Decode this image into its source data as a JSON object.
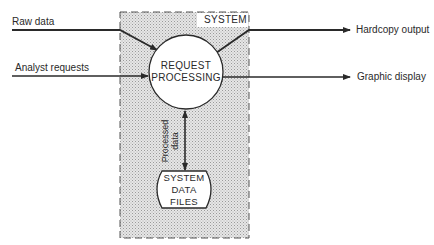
{
  "diagram": {
    "type": "data-flow",
    "system_box": {
      "label": "SYSTEM"
    },
    "process": {
      "line1": "REQUEST",
      "line2": "PROCESSING"
    },
    "data_store": {
      "line1": "SYSTEM",
      "line2": "DATA",
      "line3": "FILES"
    },
    "internal_flow": {
      "line1": "Processed",
      "line2": "data"
    },
    "inputs": [
      {
        "label": "Raw data"
      },
      {
        "label": "Analyst requests"
      }
    ],
    "outputs": [
      {
        "label": "Hardcopy output"
      },
      {
        "label": "Graphic display"
      }
    ],
    "colors": {
      "line": "#2a2a2a",
      "box_fill": "#d9d9d9",
      "background": "#ffffff"
    }
  }
}
